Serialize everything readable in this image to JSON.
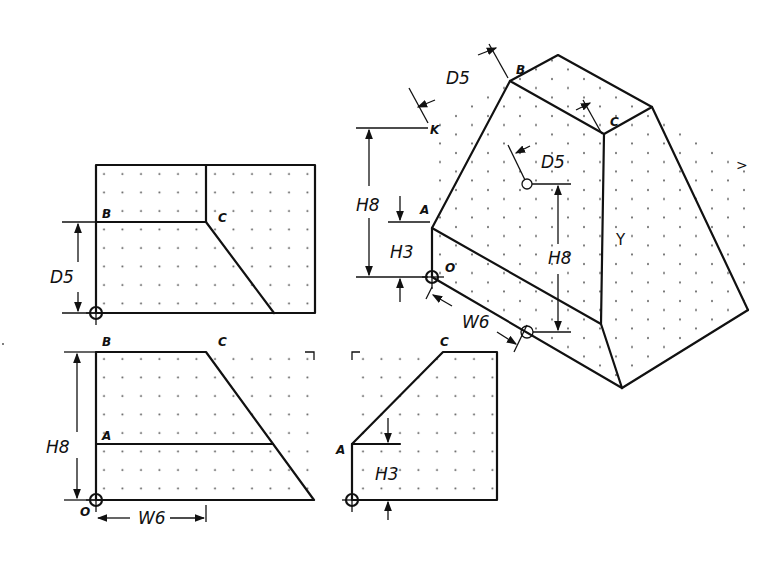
{
  "views": {
    "top": {
      "labels": {
        "B": "B",
        "C": "C"
      },
      "dimension": "D5"
    },
    "front": {
      "labels": {
        "B": "B",
        "C": "C",
        "A": "A",
        "O": "O"
      },
      "dimensions": {
        "height": "H8",
        "width": "W6"
      }
    },
    "side": {
      "labels": {
        "A": "A",
        "C": "C"
      },
      "dimension": "H3"
    },
    "isometric": {
      "labels": {
        "B": "B",
        "C": "C",
        "A": "A",
        "O": "O",
        "x_axis": ">",
        "y_axis": "Y",
        "z_axis": "K"
      },
      "dimensions": {
        "depth_top": "D5",
        "depth_mid": "D5",
        "height_left": "H8",
        "height_inner": "H3",
        "height_right": "H8",
        "width": "W6"
      }
    }
  }
}
